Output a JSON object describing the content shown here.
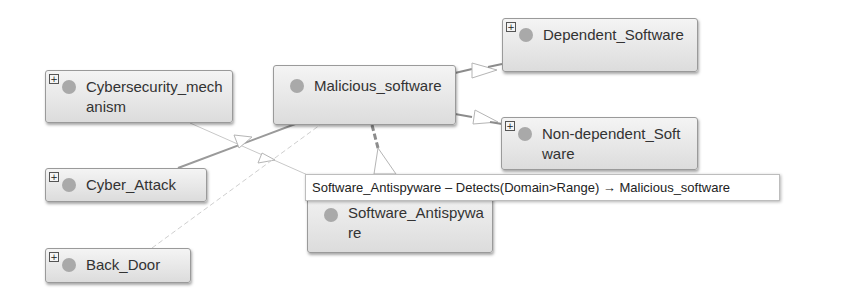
{
  "nodes": {
    "cybersecurity_mechanism": {
      "label": "Cybersecurity_mechanism",
      "expander": "+",
      "expandable": true
    },
    "malicious_software": {
      "label": "Malicious_software",
      "expandable": false
    },
    "dependent_software": {
      "label": "Dependent_Software",
      "expander": "+",
      "expandable": true
    },
    "non_dependent_software": {
      "label": "Non-dependent_Software",
      "expander": "+",
      "expandable": true
    },
    "cyber_attack": {
      "label": "Cyber_Attack",
      "expander": "+",
      "expandable": true
    },
    "software_antispyware": {
      "label": "Software_Antispyware",
      "expandable": false
    },
    "back_door": {
      "label": "Back_Door",
      "expander": "+",
      "expandable": true
    }
  },
  "tooltip": {
    "text": "Software_Antispyware – Detects(Domain>Range) → Malicious_software"
  },
  "edges": [
    {
      "from": "Malicious_software",
      "to": "Dependent_Software",
      "type": "subclass"
    },
    {
      "from": "Malicious_software",
      "to": "Non-dependent_Software",
      "type": "subclass"
    },
    {
      "from": "Cyber_Attack",
      "to": "Malicious_software",
      "type": "relation"
    },
    {
      "from": "Cybersecurity_mechanism",
      "to": "Software_Antispyware",
      "type": "subclass"
    },
    {
      "from": "Back_Door",
      "to": "Malicious_software",
      "type": "dashed"
    },
    {
      "from": "Software_Antispyware",
      "to": "Malicious_software",
      "type": "detects"
    }
  ],
  "colors": {
    "node_fill": "#e6e6e6",
    "node_border": "#9a9a9a",
    "dot": "#a9a9a9",
    "edge_dark": "#8c8c8c",
    "edge_light": "#c8c8c8"
  }
}
